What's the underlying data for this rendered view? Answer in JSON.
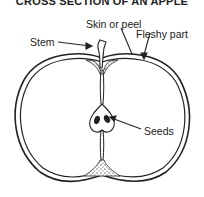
{
  "diagram": {
    "title": "CROSS SECTION OF AN APPLE",
    "labels": {
      "skin": "Skin or peel",
      "stem": "Stem",
      "flesh": "Fleshy part",
      "seeds": "Seeds"
    },
    "colors": {
      "line": "#222222",
      "background": "#ffffff",
      "stipple": "#555555"
    }
  }
}
